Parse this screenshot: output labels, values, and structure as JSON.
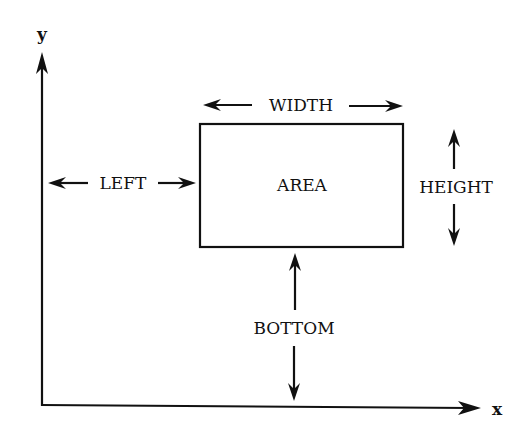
{
  "diagram": {
    "axes": {
      "x_label": "x",
      "y_label": "y"
    },
    "box": {
      "label": "AREA"
    },
    "dimensions": {
      "width": "WIDTH",
      "height": "HEIGHT",
      "left": "LEFT",
      "bottom": "BOTTOM"
    },
    "colors": {
      "ink": "#111111",
      "background": "#ffffff"
    }
  }
}
